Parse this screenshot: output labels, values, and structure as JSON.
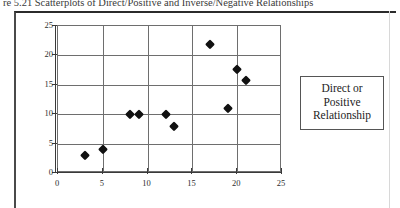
{
  "figure": {
    "caption": "re 5.21  Scatterplots of Direct/Positive and Inverse/Negative Relationships"
  },
  "annotation": {
    "line1": "Direct or",
    "line2": "Positive",
    "line3": "Relationship"
  },
  "chart_data": {
    "type": "scatter",
    "title": "",
    "xlabel": "",
    "ylabel": "",
    "xlim": [
      0,
      25
    ],
    "ylim": [
      0,
      25
    ],
    "xticks": [
      0,
      5,
      10,
      15,
      20,
      25
    ],
    "yticks": [
      0,
      5,
      10,
      15,
      20,
      25
    ],
    "xtick_labels": [
      "0",
      "5",
      "10",
      "15",
      "20",
      "25"
    ],
    "ytick_labels": [
      "0",
      "5",
      "10",
      "15",
      "20",
      "25"
    ],
    "grid": true,
    "legend": false,
    "marker": "diamond",
    "marker_color": "#111111",
    "series": [
      {
        "name": "Direct or Positive Relationship",
        "points": [
          [
            3,
            3
          ],
          [
            5,
            4
          ],
          [
            8,
            10
          ],
          [
            9,
            10
          ],
          [
            12,
            10
          ],
          [
            13,
            8
          ],
          [
            17,
            22
          ],
          [
            19,
            11
          ],
          [
            20,
            17.7
          ],
          [
            21,
            15.8
          ]
        ]
      }
    ]
  }
}
